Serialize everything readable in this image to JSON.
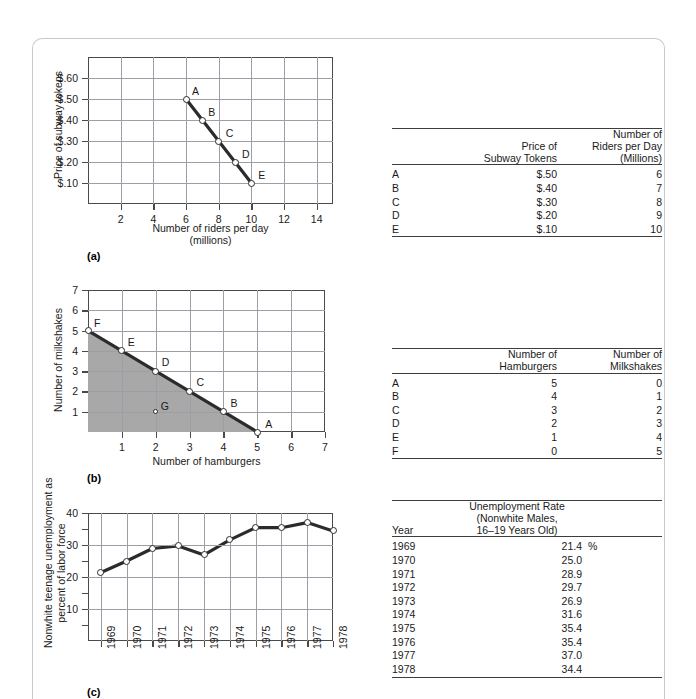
{
  "page": {
    "figures": [
      {
        "id": "a",
        "label": "(a)"
      },
      {
        "id": "b",
        "label": "(b)"
      },
      {
        "id": "c",
        "label": "(c)"
      }
    ]
  },
  "chart_data": [
    {
      "type": "line",
      "id": "chart-a",
      "title": "",
      "xlabel": "Number of riders per day",
      "xlabel_line2": "(millions)",
      "ylabel": "Price of subway tokens",
      "xlim": [
        0,
        15
      ],
      "ylim": [
        0,
        0.7
      ],
      "xticks": [
        2,
        4,
        6,
        8,
        10,
        12,
        14
      ],
      "xticklabels": [
        "2",
        "4",
        "6",
        "8",
        "10",
        "12",
        "14"
      ],
      "yticks": [
        0.1,
        0.2,
        0.3,
        0.4,
        0.5,
        0.6
      ],
      "yticklabels": [
        "$.10",
        "$.20",
        "$.30",
        "$.40",
        "$.50",
        "$.60"
      ],
      "grid": true,
      "x": [
        6,
        7,
        8,
        9,
        10
      ],
      "y": [
        0.5,
        0.4,
        0.3,
        0.2,
        0.1
      ],
      "point_labels": [
        "A",
        "B",
        "C",
        "D",
        "E"
      ]
    },
    {
      "type": "line",
      "id": "chart-b",
      "title": "",
      "xlabel": "Number of hamburgers",
      "ylabel": "Number of milkshakes",
      "xlim": [
        0,
        7
      ],
      "ylim": [
        0,
        7
      ],
      "xticks": [
        1,
        2,
        3,
        4,
        5,
        6,
        7
      ],
      "xticklabels": [
        "1",
        "2",
        "3",
        "4",
        "5",
        "6",
        "7"
      ],
      "yticks": [
        1,
        2,
        3,
        4,
        5,
        6,
        7
      ],
      "yticklabels": [
        "1",
        "2",
        "3",
        "4",
        "5",
        "6",
        "7"
      ],
      "grid": true,
      "x": [
        0,
        1,
        2,
        3,
        4,
        5
      ],
      "y": [
        5,
        4,
        3,
        2,
        1,
        0
      ],
      "point_labels": [
        "F",
        "E",
        "D",
        "C",
        "B",
        "A"
      ],
      "shaded_region": true,
      "extra_points": [
        {
          "label": "G",
          "x": 2,
          "y": 1
        }
      ]
    },
    {
      "type": "line",
      "id": "chart-c",
      "title": "",
      "xlabel": "",
      "ylabel": "Nonwhite teenage unemployment as percent of labor force",
      "ylabel_line1": "Nonwhite teenage unemployment as",
      "ylabel_line2": "percent of labor force",
      "xlim": [
        1968.5,
        1978
      ],
      "ylim": [
        0,
        40
      ],
      "xticks": [
        1969,
        1970,
        1971,
        1972,
        1973,
        1974,
        1975,
        1976,
        1977,
        1978
      ],
      "xticklabels": [
        "1969",
        "1970",
        "1971",
        "1972",
        "1973",
        "1974",
        "1975",
        "1976",
        "1977",
        "1978"
      ],
      "yticks": [
        10,
        20,
        30,
        40
      ],
      "yticklabels": [
        "10",
        "20",
        "30",
        "40"
      ],
      "minor_yticks": [
        5,
        15,
        25,
        35
      ],
      "grid": true,
      "x": [
        1969,
        1970,
        1971,
        1972,
        1973,
        1974,
        1975,
        1976,
        1977,
        1978
      ],
      "y": [
        21.4,
        25.0,
        28.9,
        29.7,
        26.9,
        31.6,
        35.4,
        35.4,
        37.0,
        34.4
      ]
    }
  ],
  "tables": [
    {
      "id": "table-a",
      "headers": {
        "row_label": "",
        "col1_line1": "Price of",
        "col1_line2": "Subway Tokens",
        "col2_line1": "Number of",
        "col2_line2": "Riders per Day",
        "col2_line3": "(Millions)"
      },
      "rows": [
        {
          "label": "A",
          "col1": "$.50",
          "col2": "6"
        },
        {
          "label": "B",
          "col1": "$.40",
          "col2": "7"
        },
        {
          "label": "C",
          "col1": "$.30",
          "col2": "8"
        },
        {
          "label": "D",
          "col1": "$.20",
          "col2": "9"
        },
        {
          "label": "E",
          "col1": "$.10",
          "col2": "10"
        }
      ]
    },
    {
      "id": "table-b",
      "headers": {
        "row_label": "",
        "col1_line1": "Number of",
        "col1_line2": "Hamburgers",
        "col2_line1": "Number of",
        "col2_line2": "Milkshakes"
      },
      "rows": [
        {
          "label": "A",
          "col1": "5",
          "col2": "0"
        },
        {
          "label": "B",
          "col1": "4",
          "col2": "1"
        },
        {
          "label": "C",
          "col1": "3",
          "col2": "2"
        },
        {
          "label": "D",
          "col1": "2",
          "col2": "3"
        },
        {
          "label": "E",
          "col1": "1",
          "col2": "4"
        },
        {
          "label": "F",
          "col1": "0",
          "col2": "5"
        }
      ]
    },
    {
      "id": "table-c",
      "headers": {
        "row_label": "Year",
        "col1_line1": "Unemployment Rate",
        "col1_line2": "(Nonwhite Males,",
        "col1_line3": "16–19 Years Old)"
      },
      "rows": [
        {
          "label": "1969",
          "col1": "21.4",
          "unit": "%"
        },
        {
          "label": "1970",
          "col1": "25.0",
          "unit": ""
        },
        {
          "label": "1971",
          "col1": "28.9",
          "unit": ""
        },
        {
          "label": "1972",
          "col1": "29.7",
          "unit": ""
        },
        {
          "label": "1973",
          "col1": "26.9",
          "unit": ""
        },
        {
          "label": "1974",
          "col1": "31.6",
          "unit": ""
        },
        {
          "label": "1975",
          "col1": "35.4",
          "unit": ""
        },
        {
          "label": "1976",
          "col1": "35.4",
          "unit": ""
        },
        {
          "label": "1977",
          "col1": "37.0",
          "unit": ""
        },
        {
          "label": "1978",
          "col1": "34.4",
          "unit": ""
        }
      ]
    }
  ],
  "colors": {
    "line": "#2b2b2b",
    "grid": "#9aa0a6",
    "axis": "#4a4a4a",
    "shade": "#a8a8a8",
    "page_border": "#c9c9c9"
  }
}
